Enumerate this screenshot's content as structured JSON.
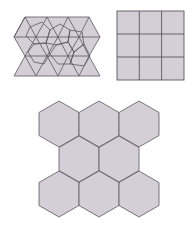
{
  "figures": [
    {
      "name": "triangle-tiling-with-overlay",
      "description": "Band of equilateral triangles (3 rows) with overlaid hexagon/pentagon-like outlines",
      "rows": 3
    },
    {
      "name": "square-tiling",
      "description": "3 by 3 grid of squares",
      "rows": 3,
      "cols": 3
    },
    {
      "name": "hexagon-tiling",
      "description": "8 regular hexagons arranged 3-2-3",
      "row_counts": [
        3,
        2,
        3
      ]
    }
  ],
  "colors": {
    "fill": "#d4cfd6",
    "stroke": "#5b5660",
    "background": "#ffffff"
  }
}
